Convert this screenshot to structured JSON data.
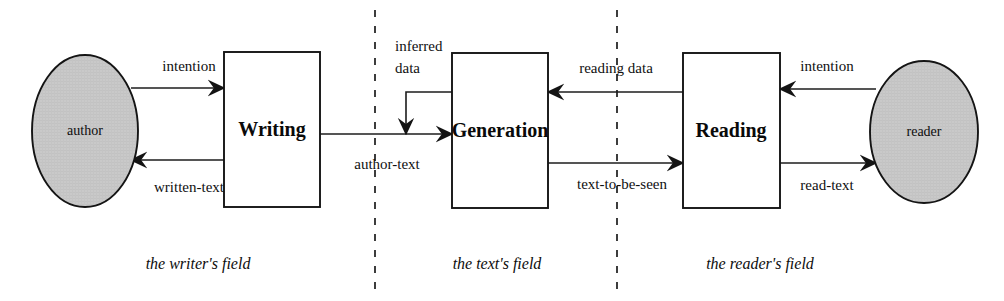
{
  "diagram": {
    "background_color": "#ffffff",
    "line_color": "#1c1c1c",
    "actor_fill_color": "#c9c9c9",
    "box_fill_color": "#ffffff"
  },
  "actors": [
    {
      "id": "author",
      "label": "author",
      "cx": 85,
      "cy": 131,
      "rx": 53,
      "ry": 76
    },
    {
      "id": "reader",
      "label": "reader",
      "cx": 924,
      "cy": 132,
      "rx": 54,
      "ry": 71
    }
  ],
  "processes": [
    {
      "id": "writing",
      "label": "Writing",
      "x": 224,
      "y": 52,
      "width": 96,
      "height": 155
    },
    {
      "id": "generation",
      "label": "Generation",
      "x": 452,
      "y": 53,
      "width": 96,
      "height": 155
    },
    {
      "id": "reading",
      "label": "Reading",
      "x": 683,
      "y": 53,
      "width": 97,
      "height": 155
    }
  ],
  "edges": [
    {
      "id": "intention-left",
      "label": "intention",
      "from": "author",
      "to": "writing",
      "direction": "right",
      "label_x": 189,
      "label_y": 68,
      "label_anchor": "middle"
    },
    {
      "id": "written-text",
      "label": "written-text",
      "from": "writing",
      "to": "author",
      "direction": "left",
      "label_x": 189,
      "label_y": 189,
      "label_anchor": "middle"
    },
    {
      "id": "author-text",
      "label": "author-text",
      "from": "writing",
      "to": "generation",
      "direction": "right",
      "label_x": 387,
      "label_y": 166,
      "label_anchor": "middle"
    },
    {
      "id": "inferred-data",
      "label": "inferred\ndata",
      "label_line_1": "inferred",
      "label_line_2": "data",
      "from": "generation",
      "to": "author-text",
      "direction": "down",
      "label_x": 395,
      "label_y": 48,
      "label_anchor": "start"
    },
    {
      "id": "reading-data",
      "label": "reading data",
      "from": "reading",
      "to": "generation",
      "direction": "left",
      "label_x": 616,
      "label_y": 70,
      "label_anchor": "middle"
    },
    {
      "id": "text-to-be-seen",
      "label": "text-to-be-seen",
      "from": "generation",
      "to": "reading",
      "direction": "right",
      "label_x": 622,
      "label_y": 186,
      "label_anchor": "middle"
    },
    {
      "id": "intention-right",
      "label": "intention",
      "from": "reader",
      "to": "reading",
      "direction": "left",
      "label_x": 827,
      "label_y": 68,
      "label_anchor": "middle"
    },
    {
      "id": "read-text",
      "label": "read-text",
      "from": "reading",
      "to": "reader",
      "direction": "right",
      "label_x": 827,
      "label_y": 187,
      "label_anchor": "middle"
    }
  ],
  "dividers": [
    {
      "id": "divider-writer-text",
      "x": 375,
      "y1": 10,
      "y2": 291
    },
    {
      "id": "divider-text-reader",
      "x": 617,
      "y1": 10,
      "y2": 291
    }
  ],
  "fields": [
    {
      "id": "writers-field",
      "label": "the writer's field",
      "x": 198,
      "y": 265
    },
    {
      "id": "texts-field",
      "label": "the text's field",
      "x": 497,
      "y": 265
    },
    {
      "id": "readers-field",
      "label": "the reader's field",
      "x": 760,
      "y": 265
    }
  ]
}
